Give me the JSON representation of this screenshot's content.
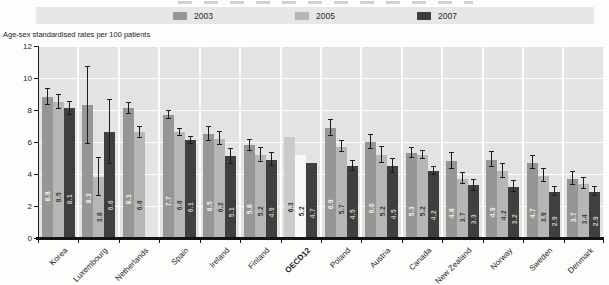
{
  "axis_title": "Age-sex standardised rates per 100 patients",
  "legend": {
    "items": [
      "2003",
      "2005",
      "2007"
    ]
  },
  "colors": {
    "page_bg": "#fdfdfc",
    "legend_bg": "#e7e7e5",
    "panel_bg": "#e3e3e1",
    "gridline": "#ffffff",
    "axis": "#141412",
    "error_bar": "#1b1b19",
    "series_2003_fill": "#969694",
    "series_2003_text": "#f4f4f2",
    "series_2005_fill": "#b6b6b4",
    "series_2005_text": "#3a3a38",
    "series_2007_fill": "#3f3f3d",
    "series_2007_text": "#c9c9c7",
    "oecd_2003_fill": "#cbcbc9",
    "oecd_2003_text": "#2e2e2c",
    "oecd_2005_fill": "#f8f8f6",
    "oecd_2005_text": "#2e2e2c",
    "oecd_2007_fill": "#3f3f3d",
    "oecd_2007_text": "#c9c9c7"
  },
  "chart_data": {
    "type": "bar",
    "title": "",
    "xlabel": "",
    "ylabel": "Age-sex standardised rates per 100 patients",
    "ylim": [
      0,
      12
    ],
    "yticks": [
      0,
      2,
      4,
      6,
      8,
      10,
      12
    ],
    "grid": true,
    "legend_position": "top",
    "emphasized_category": "OECD12",
    "categories": [
      "Korea",
      "Luxembourg",
      "Netherlands",
      "Spain",
      "Ireland",
      "Finland",
      "OECD12",
      "Poland",
      "Austria",
      "Canada",
      "New Zealand",
      "Norway",
      "Sweden",
      "Denmark"
    ],
    "series": [
      {
        "name": "2003",
        "values": [
          8.8,
          8.3,
          8.1,
          7.7,
          6.5,
          5.8,
          6.3,
          6.9,
          6.0,
          5.3,
          4.8,
          4.9,
          4.7,
          3.7
        ]
      },
      {
        "name": "2005",
        "values": [
          8.5,
          3.8,
          6.6,
          6.6,
          6.2,
          5.2,
          5.2,
          5.7,
          5.2,
          5.2,
          3.7,
          4.2,
          3.9,
          3.4
        ]
      },
      {
        "name": "2007",
        "values": [
          8.1,
          6.6,
          null,
          6.1,
          5.1,
          4.9,
          4.7,
          4.5,
          4.5,
          4.2,
          3.3,
          3.2,
          2.9,
          2.9
        ]
      }
    ],
    "error_bars": {
      "2003": [
        0.5,
        2.4,
        0.35,
        0.25,
        0.45,
        0.35,
        null,
        0.5,
        0.45,
        0.3,
        0.5,
        0.45,
        0.4,
        0.4
      ],
      "2005": [
        0.45,
        1.2,
        0.35,
        0.2,
        0.4,
        0.45,
        null,
        0.35,
        0.5,
        0.25,
        0.35,
        0.45,
        0.4,
        0.35
      ],
      "2007": [
        0.4,
        2.0,
        null,
        0.2,
        0.45,
        0.4,
        null,
        0.3,
        0.45,
        0.25,
        0.35,
        0.35,
        0.3,
        0.3
      ]
    }
  }
}
